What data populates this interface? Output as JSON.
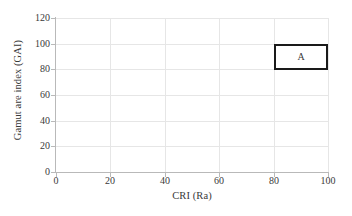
{
  "chart_data": {
    "type": "scatter",
    "title": "",
    "xlabel": "CRI (Ra)",
    "ylabel": "Gamut are index (GAI)",
    "xlim": [
      0,
      100
    ],
    "ylim": [
      0,
      120
    ],
    "xticks": [
      0,
      20,
      40,
      60,
      80,
      100
    ],
    "yticks": [
      0,
      20,
      40,
      60,
      80,
      100,
      120
    ],
    "xtick_labels": [
      "0",
      "20",
      "40",
      "60",
      "80",
      "100"
    ],
    "ytick_labels": [
      "0",
      "20",
      "40",
      "60",
      "80",
      "100",
      "120"
    ],
    "grid": true,
    "legend": "none",
    "series": [],
    "regions": [
      {
        "label": "A",
        "x_start": 80,
        "x_end": 100,
        "y_start": 80,
        "y_end": 100,
        "edge_color": "#1a1a1a",
        "fill_color": "#ffffff",
        "line_width": 2.6
      }
    ],
    "colors": {
      "axis": "#b9b9b9",
      "grid": "#e6e6e6",
      "text": "#3a3a3a",
      "background": "#ffffff"
    }
  }
}
